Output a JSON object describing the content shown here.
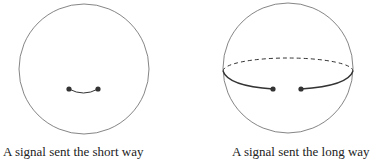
{
  "figures": [
    {
      "caption": "A signal sent the short way",
      "circle": {
        "cx": 84,
        "cy": 69,
        "r": 65
      },
      "points": [
        {
          "x": 69,
          "y": 89
        },
        {
          "x": 98,
          "y": 89
        }
      ]
    },
    {
      "caption": "A signal sent the long way",
      "circle": {
        "cx": 288,
        "cy": 68,
        "r": 65
      },
      "points": [
        {
          "x": 273,
          "y": 89
        },
        {
          "x": 301,
          "y": 89
        }
      ]
    }
  ],
  "colors": {
    "stroke": "#555555",
    "path": "#333333",
    "dot": "#333333"
  }
}
